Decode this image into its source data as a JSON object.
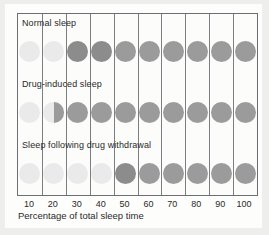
{
  "chart_data": {
    "type": "heatmap",
    "title": "",
    "subtitle": "",
    "xlabel": "Percentage of total sleep time",
    "ylabel": "",
    "xlim": [
      5,
      105
    ],
    "grid": true,
    "legend_position": "none",
    "categories": [
      "10",
      "20",
      "30",
      "40",
      "50",
      "60",
      "70",
      "80",
      "90",
      "100"
    ],
    "x": [
      10,
      20,
      30,
      40,
      50,
      60,
      70,
      80,
      90,
      100
    ],
    "marker": "circle",
    "series": [
      {
        "name": "Normal sleep",
        "values": [
          0,
          0,
          1,
          1,
          1,
          1,
          1,
          1,
          1,
          1
        ],
        "fills": [
          "light",
          "light",
          "dark",
          "dark",
          "mid",
          "mid",
          "mid",
          "mid",
          "mid",
          "mid"
        ]
      },
      {
        "name": "Drug-induced sleep",
        "values": [
          0,
          0.5,
          1,
          1,
          1,
          1,
          1,
          1,
          1,
          1
        ],
        "fills": [
          "light",
          "half",
          "mid",
          "mid",
          "mid",
          "mid",
          "mid",
          "mid",
          "mid",
          "mid"
        ]
      },
      {
        "name": "Sleep following drug withdrawal",
        "values": [
          0,
          0,
          0,
          0,
          1,
          1,
          1,
          1,
          1,
          1
        ],
        "fills": [
          "light",
          "light",
          "light",
          "light",
          "dark",
          "mid",
          "mid",
          "mid",
          "mid",
          "mid"
        ]
      }
    ]
  },
  "axis": {
    "title": "Percentage of total sleep time",
    "ticks": [
      "10",
      "20",
      "30",
      "40",
      "50",
      "60",
      "70",
      "80",
      "90",
      "100"
    ]
  },
  "rows": [
    {
      "label": "Normal sleep"
    },
    {
      "label": "Drug-induced sleep"
    },
    {
      "label": "Sleep following drug withdrawal"
    }
  ],
  "colors": {
    "light": "#eaeaea",
    "mid": "#9b9b9b",
    "dark": "#8c8c8c",
    "grid_line": "#7b7f84",
    "frame": "#6b6f73",
    "plot_background": "#fcfcfb",
    "page_background": "#fdfdfc",
    "figure_background": "#eeeeec",
    "text": "#2a2a2a"
  }
}
